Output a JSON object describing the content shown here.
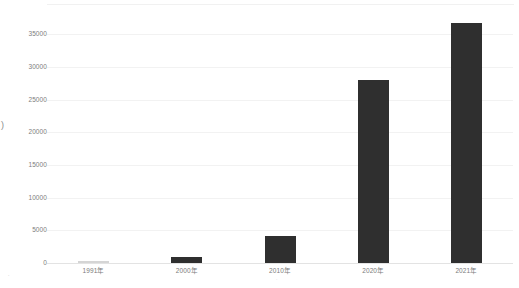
{
  "chart_data": {
    "type": "bar",
    "title": "",
    "subtitle": "",
    "xlabel": "",
    "ylabel": ")",
    "categories": [
      "1991年",
      "2000年",
      "2010年",
      "2020年",
      "2021年"
    ],
    "values": [
      300,
      900,
      4200,
      28000,
      36700
    ],
    "ylim": [
      0,
      37500
    ],
    "ytick_labels": [
      "0",
      "5000",
      "10000",
      "15000",
      "20000",
      "25000",
      "30000",
      "35000"
    ],
    "ytick_values": [
      0,
      5000,
      10000,
      15000,
      20000,
      25000,
      30000,
      35000
    ],
    "grid": true,
    "legend": "none",
    "series": [
      {
        "name": "",
        "values": [
          300,
          900,
          4200,
          28000,
          36700
        ]
      }
    ],
    "bar_color": "#2f2f2f",
    "first_bar_color": "#d5d5d5",
    "gridline_color": "#f2f2f2",
    "baseline_color": "#e3e3e3",
    "background_color": "#ffffff"
  },
  "annotations": {
    "axis_title_clip": ")",
    "corner_mark": "∙",
    "xtick_submark": "∙"
  }
}
